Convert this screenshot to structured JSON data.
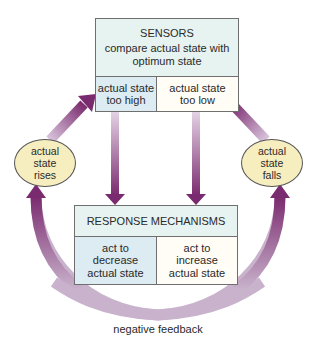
{
  "sensors": {
    "title": "SENSORS",
    "subtitle_line1": "compare actual state with",
    "subtitle_line2": "optimum state",
    "left_cell": [
      "actual state",
      "too high"
    ],
    "right_cell": [
      "actual state",
      "too low"
    ]
  },
  "response": {
    "title": "RESPONSE MECHANISMS",
    "left_cell": [
      "act to",
      "decrease",
      "actual state"
    ],
    "right_cell": [
      "act to",
      "increase",
      "actual state"
    ]
  },
  "ellipses": {
    "left": [
      "actual",
      "state",
      "rises"
    ],
    "right": [
      "actual",
      "state",
      "falls"
    ]
  },
  "caption": "negative feedback",
  "colors": {
    "arrow_dark": "#7a2a6e",
    "arrow_light": "#d9c4dc",
    "header_fill": "#e6f3f0",
    "blue_cell": "#ddebf2",
    "cream_cell": "#fffdf6",
    "ellipse_fill": "#f7eec0"
  }
}
